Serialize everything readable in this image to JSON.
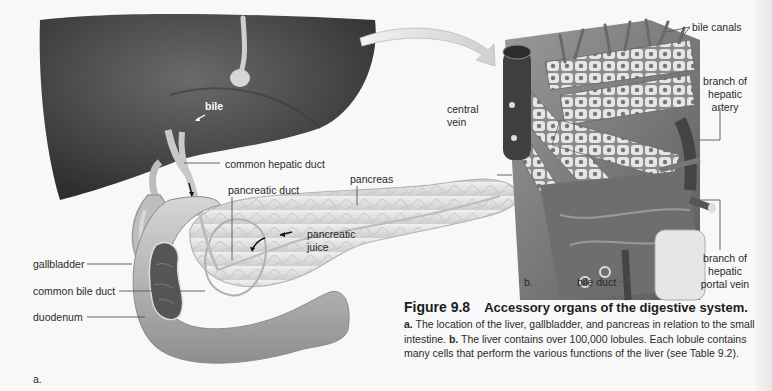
{
  "figure": {
    "number": "Figure 9.8",
    "title": "Accessory organs of the digestive system.",
    "caption_parts": [
      {
        "bold": "a.",
        "text": " The location of the liver, gallbladder, and pancreas in relation to the small intestine. "
      },
      {
        "bold": "b.",
        "text": " The liver contains over 100,000 lobules. Each lobule contains many cells that perform the various functions of the liver (see Table 9.2)."
      }
    ]
  },
  "panel_a": {
    "panel_label": "a.",
    "labels": {
      "bile": "bile",
      "common_hepatic_duct": "common hepatic duct",
      "pancreatic_duct": "pancreatic duct",
      "pancreas": "pancreas",
      "pancreatic_juice_1": "pancreatic",
      "pancreatic_juice_2": "juice",
      "gallbladder": "gallbladder",
      "common_bile_duct": "common bile duct",
      "duodenum": "duodenum"
    }
  },
  "panel_b": {
    "panel_label": "b.",
    "labels": {
      "bile_canals": "bile canals",
      "central_vein_1": "central",
      "central_vein_2": "vein",
      "hepatic_artery_1": "branch of",
      "hepatic_artery_2": "hepatic",
      "hepatic_artery_3": "artery",
      "bile_duct": "bile duct",
      "portal_vein_1": "branch of",
      "portal_vein_2": "hepatic",
      "portal_vein_3": "portal vein"
    }
  },
  "colors": {
    "liver": "#4a4a4a",
    "organ_light": "#d8d8d8",
    "pancreas": "#e4e4e4",
    "leader_line": "#555555",
    "background": "#f8f8f8"
  }
}
